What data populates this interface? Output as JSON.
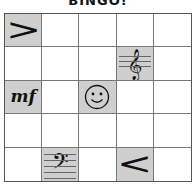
{
  "title": "BINGO!",
  "grid": {
    "rows": 5,
    "cols": 5,
    "cells": [
      {
        "symbol": ">",
        "name": "decrescendo",
        "marked": true
      },
      {
        "symbol": "",
        "name": "empty",
        "marked": false
      },
      {
        "symbol": "",
        "name": "empty",
        "marked": false
      },
      {
        "symbol": "",
        "name": "empty",
        "marked": false
      },
      {
        "symbol": "",
        "name": "empty",
        "marked": false
      },
      {
        "symbol": "",
        "name": "empty",
        "marked": false
      },
      {
        "symbol": "",
        "name": "empty",
        "marked": false
      },
      {
        "symbol": "",
        "name": "empty",
        "marked": false
      },
      {
        "symbol": "𝄞",
        "name": "treble-clef",
        "marked": true
      },
      {
        "symbol": "",
        "name": "empty",
        "marked": false
      },
      {
        "symbol": "mf",
        "name": "mezzo-forte",
        "marked": true
      },
      {
        "symbol": "",
        "name": "empty",
        "marked": false
      },
      {
        "symbol": "☺",
        "name": "smiley-free-space",
        "marked": true
      },
      {
        "symbol": "",
        "name": "empty",
        "marked": false
      },
      {
        "symbol": "",
        "name": "empty",
        "marked": false
      },
      {
        "symbol": "",
        "name": "empty",
        "marked": false
      },
      {
        "symbol": "",
        "name": "empty",
        "marked": false
      },
      {
        "symbol": "",
        "name": "empty",
        "marked": false
      },
      {
        "symbol": "",
        "name": "empty",
        "marked": false
      },
      {
        "symbol": "",
        "name": "empty",
        "marked": false
      },
      {
        "symbol": "",
        "name": "empty",
        "marked": false
      },
      {
        "symbol": "𝄢",
        "name": "bass-clef",
        "marked": true
      },
      {
        "symbol": "",
        "name": "empty",
        "marked": false
      },
      {
        "symbol": "<",
        "name": "crescendo",
        "marked": true
      },
      {
        "symbol": "",
        "name": "empty",
        "marked": false
      }
    ]
  },
  "colors": {
    "marked": "#cfcfcf",
    "unmarked": "#ffffff",
    "grid_line": "#777777"
  }
}
